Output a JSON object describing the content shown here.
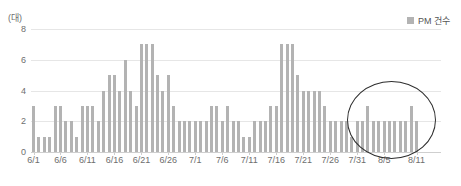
{
  "chart_data": {
    "type": "bar",
    "title": "",
    "xlabel": "",
    "ylabel": "(대)",
    "ylim": [
      0,
      8
    ],
    "yticks": [
      0,
      2,
      4,
      6,
      8
    ],
    "grid": true,
    "legend_position": "top-right",
    "series": [
      {
        "name": "PM 건수",
        "color": "#b3b3b3",
        "values": [
          3,
          1,
          1,
          1,
          3,
          3,
          2,
          2,
          1,
          3,
          3,
          3,
          2,
          4,
          5,
          5,
          4,
          6,
          4,
          3,
          7,
          7,
          7,
          5,
          4,
          5,
          3,
          2,
          2,
          2,
          2,
          2,
          2,
          3,
          3,
          2,
          3,
          2,
          2,
          1,
          1,
          2,
          2,
          2,
          3,
          3,
          7,
          7,
          7,
          5,
          4,
          4,
          4,
          4,
          3,
          2,
          2,
          2,
          2,
          1,
          2,
          2,
          3,
          2,
          2,
          2,
          2,
          2,
          2,
          2,
          3,
          2
        ]
      }
    ],
    "categories": [
      "6/1",
      "6/2",
      "6/3",
      "6/4",
      "6/5",
      "6/6",
      "6/7",
      "6/8",
      "6/9",
      "6/10",
      "6/11",
      "6/12",
      "6/13",
      "6/14",
      "6/15",
      "6/16",
      "6/17",
      "6/18",
      "6/19",
      "6/20",
      "6/21",
      "6/22",
      "6/23",
      "6/24",
      "6/25",
      "6/26",
      "6/27",
      "6/28",
      "6/29",
      "6/30",
      "7/1",
      "7/2",
      "7/3",
      "7/4",
      "7/5",
      "7/6",
      "7/7",
      "7/8",
      "7/9",
      "7/10",
      "7/11",
      "7/12",
      "7/13",
      "7/14",
      "7/15",
      "7/16",
      "7/17",
      "7/18",
      "7/19",
      "7/20",
      "7/21",
      "7/22",
      "7/23",
      "7/24",
      "7/25",
      "7/26",
      "7/27",
      "7/28",
      "7/29",
      "7/30",
      "7/31",
      "8/1",
      "8/2",
      "8/3",
      "8/4",
      "8/5",
      "8/6",
      "8/7",
      "8/8",
      "8/9",
      "8/10",
      "8/11"
    ],
    "tick_labels": [
      "6/1",
      "6/6",
      "6/11",
      "6/16",
      "6/21",
      "6/26",
      "7/1",
      "7/6",
      "7/11",
      "7/16",
      "7/21",
      "7/26",
      "7/31",
      "8/5",
      "8/11"
    ],
    "tick_indices": [
      0,
      5,
      10,
      15,
      20,
      25,
      30,
      35,
      40,
      45,
      50,
      55,
      60,
      65,
      71
    ],
    "annotations": [
      {
        "type": "ellipse",
        "label": "highlight-region",
        "covers": [
          "7/29",
          "8/11"
        ]
      }
    ]
  },
  "legend": {
    "label": "PM 건수",
    "swatch_color": "#b3b3b3"
  },
  "axis": {
    "unit_label": "(대)"
  }
}
